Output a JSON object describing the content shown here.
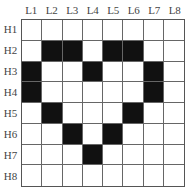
{
  "columns": [
    "L1",
    "L2",
    "L3",
    "L4",
    "L5",
    "L6",
    "L7",
    "L8"
  ],
  "rows": [
    "H1",
    "H2",
    "H3",
    "H4",
    "H5",
    "H6",
    "H7",
    "H8"
  ],
  "filled": [
    [
      0,
      0,
      0,
      0,
      0,
      0,
      0,
      0
    ],
    [
      0,
      1,
      1,
      0,
      1,
      1,
      0,
      0
    ],
    [
      1,
      0,
      0,
      1,
      0,
      0,
      1,
      0
    ],
    [
      1,
      0,
      0,
      0,
      0,
      0,
      1,
      0
    ],
    [
      0,
      1,
      0,
      0,
      0,
      1,
      0,
      0
    ],
    [
      0,
      0,
      1,
      0,
      1,
      0,
      0,
      0
    ],
    [
      0,
      0,
      0,
      1,
      0,
      0,
      0,
      0
    ],
    [
      0,
      0,
      0,
      0,
      0,
      0,
      0,
      0
    ]
  ],
  "colors": {
    "filled": "#111111",
    "empty": "#ffffff",
    "gridline": "#666666"
  }
}
